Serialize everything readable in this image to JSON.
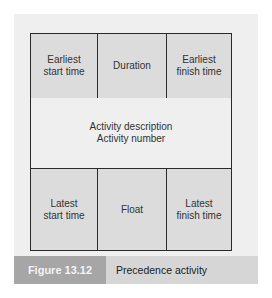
{
  "diagram": {
    "top_row": [
      "Earliest\nstart time",
      "Duration",
      "Earliest\nfinish time"
    ],
    "middle": {
      "line1": "Activity description",
      "line2": "Activity number"
    },
    "bottom_row": [
      "Latest\nstart time",
      "Float",
      "Latest\nfinish time"
    ]
  },
  "caption": {
    "figure_label": "Figure 13.12",
    "title": "Precedence activity"
  },
  "colors": {
    "panel": "#efefef",
    "cell": "#dcdcdc",
    "figure_label_bg": "#a6a6a6",
    "caption_bg": "#d6d6d6"
  }
}
